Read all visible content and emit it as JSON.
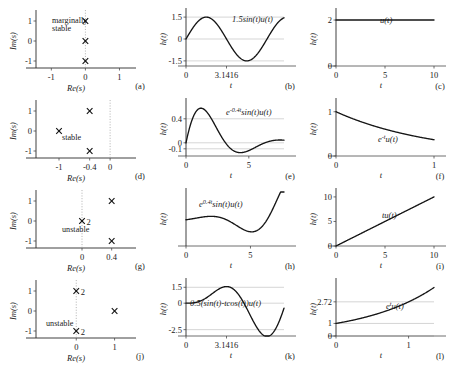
{
  "figure": {
    "title": "",
    "rows": 4,
    "cols": 3,
    "background": "#ffffff",
    "curve_color": "#151515",
    "axis_color": "#4a4a4a",
    "grid_color": "#b8b8b8"
  },
  "chart_data": [
    {
      "id": "a",
      "type": "scatter",
      "panel_label": "(a)",
      "title": "",
      "xlabel": "Re(s)",
      "ylabel": "Im(s)",
      "xlim": [
        -1.45,
        1.25
      ],
      "ylim": [
        -1.35,
        1.35
      ],
      "xticks": [
        -1,
        0,
        1
      ],
      "xticklabels": [
        "-1",
        "0",
        "1"
      ],
      "yticks": [
        -1,
        0,
        1
      ],
      "yticklabels": [
        "-1",
        "0",
        "1"
      ],
      "grid": false,
      "annotation": "marginally\nstable",
      "annotation_lines": [
        "marginally",
        "stable"
      ],
      "marker": "x",
      "poles": [
        {
          "re": 0,
          "im": 1,
          "multiplicity": 1,
          "label": ""
        },
        {
          "re": 0,
          "im": 0,
          "multiplicity": 1,
          "label": ""
        },
        {
          "re": 0,
          "im": -1,
          "multiplicity": 1,
          "label": ""
        }
      ],
      "dotted_vertical_at_re": 0
    },
    {
      "id": "b",
      "type": "line",
      "panel_label": "(b)",
      "title": "",
      "equation": "1.5sin(t)u(t)",
      "xlabel": "t",
      "ylabel": "h(t)",
      "xlim": [
        0,
        7.6
      ],
      "ylim": [
        -1.85,
        1.85
      ],
      "xticks": [
        0,
        3.1416
      ],
      "xticklabels": [
        "0",
        "3.1416"
      ],
      "yticks": [
        -1.5,
        0,
        1.5
      ],
      "yticklabels": [
        "-1.5",
        "0",
        "1.5"
      ],
      "grid": true,
      "amplitude": 1.5,
      "omega": 1.0
    },
    {
      "id": "c",
      "type": "line",
      "panel_label": "(c)",
      "title": "",
      "equation": "u(t)",
      "xlabel": "t",
      "ylabel": "h(t)",
      "xlim": [
        0,
        10
      ],
      "ylim": [
        0,
        2.35
      ],
      "xticks": [
        0,
        5,
        10
      ],
      "xticklabels": [
        "0",
        "5",
        "10"
      ],
      "yticks": [
        0,
        2
      ],
      "yticklabels": [
        "0",
        "2"
      ],
      "grid": false,
      "constant_value": 2
    },
    {
      "id": "d",
      "type": "scatter",
      "panel_label": "(d)",
      "title": "",
      "xlabel": "Re(s)",
      "ylabel": "Im(s)",
      "xlim": [
        -1.45,
        0.35
      ],
      "ylim": [
        -1.35,
        1.35
      ],
      "xticks": [
        -1,
        -0.4,
        0
      ],
      "xticklabels": [
        "-1",
        "-0.4",
        "0"
      ],
      "yticks": [
        -1,
        0,
        1
      ],
      "yticklabels": [
        "-1",
        "0",
        "1"
      ],
      "grid": false,
      "annotation": "stable",
      "annotation_lines": [
        "stable"
      ],
      "marker": "x",
      "poles": [
        {
          "re": -1,
          "im": 0,
          "multiplicity": 1,
          "label": ""
        },
        {
          "re": -0.4,
          "im": 1,
          "multiplicity": 1,
          "label": ""
        },
        {
          "re": -0.4,
          "im": -1,
          "multiplicity": 1,
          "label": ""
        }
      ],
      "dotted_vertical_at_re": 0
    },
    {
      "id": "e",
      "type": "line",
      "panel_label": "(e)",
      "title": "",
      "equation": "e^-0.4t sin(t)u(t)",
      "equation_parts": {
        "base": "e",
        "exp": "-0.4t",
        "rest": "sin(t)u(t)"
      },
      "xlabel": "t",
      "ylabel": "h(t)",
      "xlim": [
        0,
        7.8
      ],
      "ylim": [
        -0.22,
        0.68
      ],
      "xticks": [
        0,
        5
      ],
      "xticklabels": [
        "0",
        "5"
      ],
      "yticks": [
        -0.1,
        0,
        0.4
      ],
      "yticklabels": [
        "-0.1",
        "0",
        "0.4"
      ],
      "grid": true,
      "decay": -0.4,
      "omega": 1.0
    },
    {
      "id": "f",
      "type": "line",
      "panel_label": "(f)",
      "title": "",
      "equation": "e^-t u(t)",
      "equation_parts": {
        "base": "e",
        "exp": "-t",
        "rest": "u(t)"
      },
      "xlabel": "t",
      "ylabel": "h(t)",
      "xlim": [
        0,
        1
      ],
      "ylim": [
        0,
        1.22
      ],
      "xticks": [
        0,
        1
      ],
      "xticklabels": [
        "0",
        "1"
      ],
      "yticks": [
        0,
        1
      ],
      "yticklabels": [
        "0",
        "1"
      ],
      "grid": false,
      "decay": -1.0
    },
    {
      "id": "g",
      "type": "scatter",
      "panel_label": "(g)",
      "title": "",
      "xlabel": "Re(s)",
      "ylabel": "Im(s)",
      "xlim": [
        -0.62,
        0.62
      ],
      "ylim": [
        -1.35,
        1.35
      ],
      "xticks": [
        0,
        0.4
      ],
      "xticklabels": [
        "0",
        "0.4"
      ],
      "yticks": [
        -1,
        0,
        1
      ],
      "yticklabels": [
        "-1",
        "0",
        "1"
      ],
      "grid": false,
      "annotation": "unstable",
      "annotation_lines": [
        "unstable"
      ],
      "marker": "x",
      "poles": [
        {
          "re": 0,
          "im": 0,
          "multiplicity": 2,
          "label": "2"
        },
        {
          "re": 0.4,
          "im": 1,
          "multiplicity": 1,
          "label": ""
        },
        {
          "re": 0.4,
          "im": -1,
          "multiplicity": 1,
          "label": ""
        }
      ],
      "dotted_vertical_at_re": 0
    },
    {
      "id": "h",
      "type": "line",
      "panel_label": "(h)",
      "title": "",
      "equation": "e^0.4t sin(t)u(t)",
      "equation_parts": {
        "base": "e",
        "exp": "0.4t",
        "rest": "sin(t)u(t)"
      },
      "xlabel": "t",
      "ylabel": "h(t)",
      "xlim": [
        0,
        7.6
      ],
      "ylim": [
        -8.5,
        9.0
      ],
      "xticks": [
        0,
        5
      ],
      "xticklabels": [
        "0",
        "5"
      ],
      "yticks": [],
      "yticklabels": [],
      "grid": true,
      "decay": 0.4,
      "omega": 1.0
    },
    {
      "id": "i",
      "type": "line",
      "panel_label": "(i)",
      "title": "",
      "equation": "tu(t)",
      "xlabel": "t",
      "ylabel": "h(t)",
      "xlim": [
        0,
        10
      ],
      "ylim": [
        0,
        11.0
      ],
      "xticks": [
        0,
        5,
        10
      ],
      "xticklabels": [
        "0",
        "5",
        "10"
      ],
      "yticks": [
        0,
        5,
        10
      ],
      "yticklabels": [
        "0",
        "5",
        "10"
      ],
      "grid": false,
      "slope": 1.0
    },
    {
      "id": "j",
      "type": "scatter",
      "panel_label": "(j)",
      "title": "",
      "xlabel": "Re(s)",
      "ylabel": "Im(s)",
      "xlim": [
        -1.05,
        1.35
      ],
      "ylim": [
        -1.35,
        1.35
      ],
      "xticks": [
        0,
        1
      ],
      "xticklabels": [
        "0",
        "1"
      ],
      "yticks": [
        -1,
        0,
        1
      ],
      "yticklabels": [
        "-1",
        "0",
        "1"
      ],
      "grid": false,
      "annotation": "unstable",
      "annotation_lines": [
        "unstable"
      ],
      "marker": "x",
      "poles": [
        {
          "re": 0,
          "im": 1,
          "multiplicity": 2,
          "label": "2"
        },
        {
          "re": 0,
          "im": -1,
          "multiplicity": 2,
          "label": "2"
        },
        {
          "re": 1,
          "im": 0,
          "multiplicity": 1,
          "label": ""
        }
      ],
      "dotted_vertical_at_re": 0
    },
    {
      "id": "k",
      "type": "line",
      "panel_label": "(k)",
      "title": "",
      "equation": "0.5(sin(t)-tcos(t))u(t)",
      "xlabel": "t",
      "ylabel": "h(t)",
      "xlim": [
        0,
        7.6
      ],
      "ylim": [
        -3.1,
        2.0
      ],
      "xticks": [
        0,
        3.1416
      ],
      "xticklabels": [
        "0",
        "3.1416"
      ],
      "yticks": [
        -2.5,
        0,
        1.5
      ],
      "yticklabels": [
        "-2.5",
        "0",
        "1.5"
      ],
      "grid": true
    },
    {
      "id": "l",
      "type": "line",
      "panel_label": "(l)",
      "title": "",
      "equation": "e^t u(t)",
      "equation_parts": {
        "base": "e",
        "exp": "t",
        "rest": "u(t)"
      },
      "xlabel": "t",
      "ylabel": "h(t)",
      "xlim": [
        0,
        1.35
      ],
      "ylim": [
        0,
        4.3
      ],
      "xticks": [
        0,
        1
      ],
      "xticklabels": [
        "0",
        "1"
      ],
      "yticks": [
        0,
        1,
        2.72
      ],
      "yticklabels": [
        "0",
        "1",
        "2.72"
      ],
      "grid": true,
      "growth": 1.0
    }
  ]
}
